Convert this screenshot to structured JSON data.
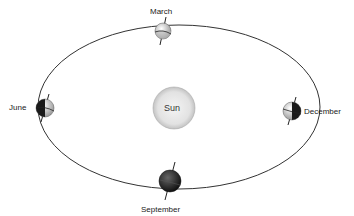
{
  "diagram": {
    "center_label": "Sun",
    "positions": [
      {
        "label": "March",
        "shading": "light-half"
      },
      {
        "label": "June",
        "shading": "left-dark"
      },
      {
        "label": "September",
        "shading": "dark"
      },
      {
        "label": "December",
        "shading": "right-dark"
      }
    ]
  },
  "colors": {
    "orbit": "#333333",
    "sun_fill": "#e6e6e6",
    "sun_edge": "#aaaaaa",
    "earth_dark": "#1a1a1a",
    "earth_light": "#e8e8e8"
  }
}
